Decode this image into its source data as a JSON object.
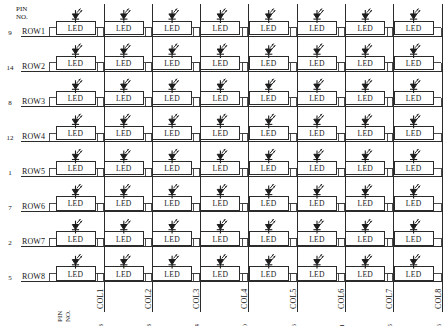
{
  "diagram": {
    "pin_header_line1": "PIN",
    "pin_header_line2": "NO.",
    "led_label": "LED",
    "led_symbol_name": "light-emitting-diode",
    "line_color": "#2b2b2b",
    "background_color": "#ffffff",
    "rows": [
      {
        "label": "ROW1",
        "pin": "9"
      },
      {
        "label": "ROW2",
        "pin": "14"
      },
      {
        "label": "ROW3",
        "pin": "8"
      },
      {
        "label": "ROW4",
        "pin": "12"
      },
      {
        "label": "ROW5",
        "pin": "1"
      },
      {
        "label": "ROW6",
        "pin": "7"
      },
      {
        "label": "ROW7",
        "pin": "2"
      },
      {
        "label": "ROW8",
        "pin": "5"
      }
    ],
    "columns": [
      {
        "label": "COL1",
        "pin": "13"
      },
      {
        "label": "COL2",
        "pin": "3"
      },
      {
        "label": "COL3",
        "pin": "4"
      },
      {
        "label": "COL4",
        "pin": "10"
      },
      {
        "label": "COL5",
        "pin": "6"
      },
      {
        "label": "COL6",
        "pin": "11"
      },
      {
        "label": "COL7",
        "pin": "15"
      },
      {
        "label": "COL8",
        "pin": "16"
      }
    ],
    "grid": {
      "row_count": 8,
      "column_count": 8,
      "led_count": 64
    }
  }
}
